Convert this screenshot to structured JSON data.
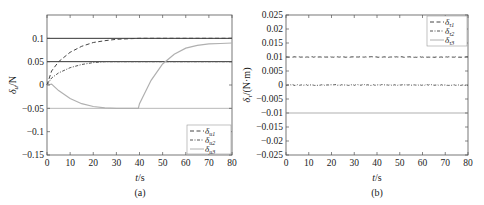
{
  "chart_data": [
    {
      "id": "a",
      "type": "line",
      "caption": "(a)",
      "title": "",
      "xlabel": "t/s",
      "ylabel": "δu/N",
      "xlim": [
        0,
        80
      ],
      "ylim": [
        -0.15,
        0.15
      ],
      "xticks": [
        0,
        10,
        20,
        30,
        40,
        50,
        60,
        70,
        80
      ],
      "xtick_labels": [
        "0",
        "10",
        "20",
        "30",
        "40",
        "50",
        "60",
        "70",
        "80"
      ],
      "yticks": [
        0.1,
        0.05,
        0,
        -0.05,
        -0.1,
        -0.15
      ],
      "ytick_labels": [
        "0.1",
        "0.05",
        "0",
        "−0.05",
        "−0.1",
        "−0.15"
      ],
      "grid": false,
      "legend_position": "lower right",
      "reference_lines": [
        0.1,
        0.05,
        -0.05
      ],
      "series": [
        {
          "name": "δu1",
          "style": "dashed",
          "color": "#444444",
          "x": [
            0,
            2,
            5,
            10,
            15,
            20,
            25,
            30,
            40,
            50,
            60,
            70,
            80
          ],
          "y": [
            0,
            0.03,
            0.05,
            0.07,
            0.083,
            0.091,
            0.095,
            0.098,
            0.1,
            0.1,
            0.1,
            0.1,
            0.1
          ]
        },
        {
          "name": "δu2",
          "style": "dash-dot",
          "color": "#555555",
          "x": [
            0,
            2,
            5,
            10,
            15,
            20,
            25,
            30,
            40,
            50,
            60,
            70,
            80
          ],
          "y": [
            0,
            0.015,
            0.026,
            0.037,
            0.044,
            0.048,
            0.05,
            0.05,
            0.05,
            0.05,
            0.05,
            0.05,
            0.05
          ]
        },
        {
          "name": "δu3",
          "style": "solid",
          "color": "#b0b0b0",
          "x": [
            0,
            2,
            5,
            10,
            15,
            20,
            25,
            30,
            35,
            39.5,
            40,
            45,
            50,
            55,
            60,
            65,
            70,
            75,
            80
          ],
          "y": [
            0,
            0.002,
            -0.012,
            -0.029,
            -0.04,
            -0.046,
            -0.049,
            -0.05,
            -0.05,
            -0.05,
            -0.04,
            0.01,
            0.045,
            0.066,
            0.079,
            0.085,
            0.088,
            0.089,
            0.09
          ]
        }
      ],
      "legend": [
        "δu1",
        "δu2",
        "δu3"
      ]
    },
    {
      "id": "b",
      "type": "line",
      "caption": "(b)",
      "title": "",
      "xlabel": "t/s",
      "ylabel": "δτ/(N·m)",
      "xlim": [
        0,
        80
      ],
      "ylim": [
        -0.025,
        0.025
      ],
      "xticks": [
        0,
        10,
        20,
        30,
        40,
        50,
        60,
        70,
        80
      ],
      "xtick_labels": [
        "0",
        "10",
        "20",
        "30",
        "40",
        "50",
        "60",
        "70",
        "80"
      ],
      "yticks": [
        0.025,
        0.02,
        0.015,
        0.01,
        0.005,
        0,
        -0.005,
        -0.01,
        -0.015,
        -0.02,
        -0.025
      ],
      "ytick_labels": [
        "0.025",
        "0.02",
        "0.015",
        "0.01",
        "0.005",
        "0",
        "−0.005",
        "−0.01",
        "−0.015",
        "−0.02",
        "−0.025"
      ],
      "grid": false,
      "legend_position": "upper right",
      "series": [
        {
          "name": "δτ1",
          "style": "dashed",
          "color": "#444444",
          "x": [
            0,
            80
          ],
          "y": [
            0.01,
            0.01
          ]
        },
        {
          "name": "δτ2",
          "style": "dash-dot",
          "color": "#555555",
          "x": [
            0,
            80
          ],
          "y": [
            0,
            0
          ]
        },
        {
          "name": "δτ3",
          "style": "solid",
          "color": "#b0b0b0",
          "x": [
            0,
            80
          ],
          "y": [
            -0.01,
            -0.01
          ]
        }
      ],
      "legend": [
        "δτ1",
        "δτ2",
        "δτ3"
      ]
    }
  ],
  "labels": {
    "a": {
      "caption": "(a)",
      "xlabel_var": "t",
      "xlabel_unit": "/s",
      "ylabel_var": "δ",
      "ylabel_sub": "u",
      "ylabel_unit": "/N",
      "legend": [
        {
          "main": "δ",
          "sub": "u1"
        },
        {
          "main": "δ",
          "sub": "u2"
        },
        {
          "main": "δ",
          "sub": "u3"
        }
      ]
    },
    "b": {
      "caption": "(b)",
      "xlabel_var": "t",
      "xlabel_unit": "/s",
      "ylabel_var": "δ",
      "ylabel_sub": "τ",
      "ylabel_unit": "/(N·m)",
      "legend": [
        {
          "main": "δ",
          "sub": "τ1"
        },
        {
          "main": "δ",
          "sub": "τ2"
        },
        {
          "main": "δ",
          "sub": "τ3"
        }
      ]
    }
  }
}
